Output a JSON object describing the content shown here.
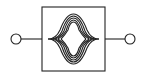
{
  "diagram": {
    "type": "schematic-symbol",
    "symbol": "filter-block-with-two-terminals",
    "stroke_color": "#222222",
    "background": "#ffffff",
    "terminals": [
      {
        "id": "input",
        "side": "left"
      },
      {
        "id": "output",
        "side": "right"
      }
    ],
    "block": {
      "glyph": "nested-bell-curves",
      "curve_count": 5
    }
  }
}
